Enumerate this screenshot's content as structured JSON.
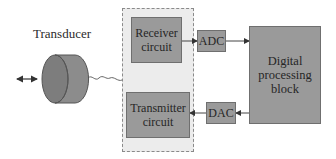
{
  "diagram": {
    "transducer": {
      "label": "Transducer"
    },
    "interface_panel": {
      "receiver": {
        "label_line1": "Receiver",
        "label_line2": "circuit"
      },
      "transmitter": {
        "label_line1": "Transmitter",
        "label_line2": "circuit"
      }
    },
    "adc": {
      "label": "ADC"
    },
    "dac": {
      "label": "DAC"
    },
    "digital_block": {
      "label_line1": "Digital",
      "label_line2": "processing",
      "label_line3": "block"
    },
    "colors": {
      "block_fill": "#9a9a9a",
      "panel_fill": "#ececec",
      "transducer_fill": "#8a8a8a",
      "line": "#444444"
    },
    "connections": [
      {
        "from": "receiver",
        "to": "adc",
        "direction": "forward"
      },
      {
        "from": "adc",
        "to": "digital_block",
        "direction": "forward"
      },
      {
        "from": "digital_block",
        "to": "dac",
        "direction": "forward"
      },
      {
        "from": "dac",
        "to": "transmitter",
        "direction": "forward"
      },
      {
        "from": "transducer",
        "to": "interface_panel",
        "type": "wavy-cable"
      },
      {
        "from": "medium",
        "to": "transducer",
        "direction": "bidirectional"
      }
    ]
  }
}
